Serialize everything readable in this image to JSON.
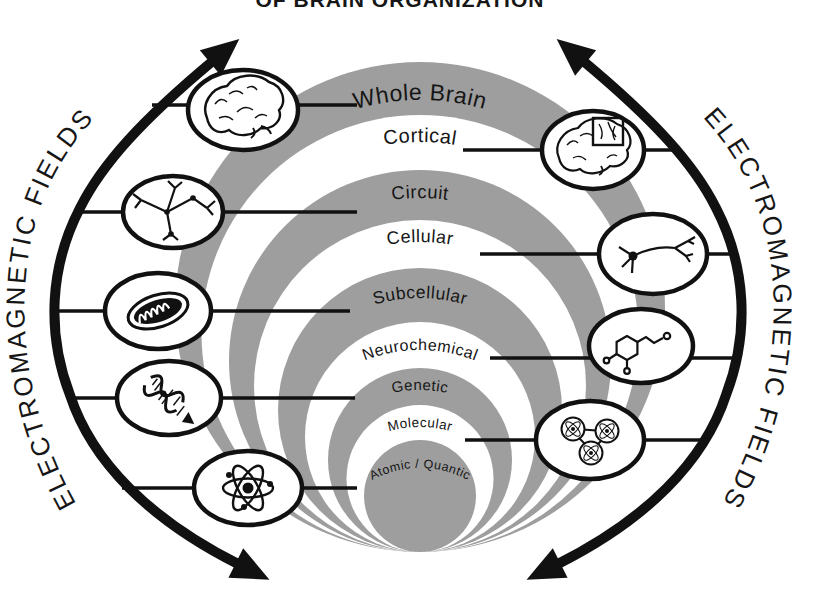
{
  "title": {
    "visible_text": "OF BRAIN ORGANIZATION"
  },
  "side_labels": {
    "left": "ELECTROMAGNETIC FIELDS",
    "right": "ELECTROMAGNETIC FIELDS"
  },
  "levels": [
    {
      "name": "Whole Brain",
      "icon": "brain-icon",
      "icon_side": "left"
    },
    {
      "name": "Cortical",
      "icon": "brain-with-cortex-box-icon",
      "icon_side": "right"
    },
    {
      "name": "Circuit",
      "icon": "neural-circuit-icon",
      "icon_side": "left"
    },
    {
      "name": "Cellular",
      "icon": "neuron-icon",
      "icon_side": "right"
    },
    {
      "name": "Subcellular",
      "icon": "mitochondrion-icon",
      "icon_side": "left"
    },
    {
      "name": "Neurochemical",
      "icon": "molecule-structure-icon",
      "icon_side": "right"
    },
    {
      "name": "Genetic",
      "icon": "dna-icon",
      "icon_side": "left"
    },
    {
      "name": "Molecular",
      "icon": "bonded-atoms-icon",
      "icon_side": "right"
    },
    {
      "name": "Atomic / Quantic",
      "icon": "atom-icon",
      "icon_side": "left"
    }
  ],
  "colors": {
    "band_gray": "#9e9e9e",
    "ink": "#111111",
    "background": "#ffffff"
  }
}
